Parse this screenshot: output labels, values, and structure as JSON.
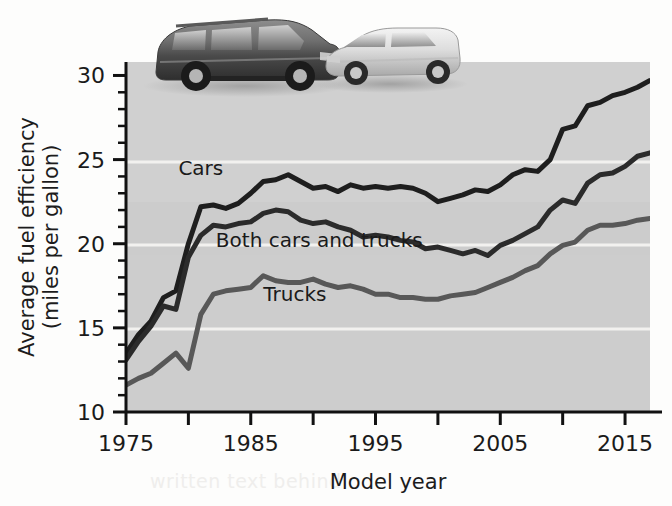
{
  "chart_data": {
    "type": "line",
    "title": "",
    "xlabel": "Model year",
    "ylabel": "Average fuel efficiency\n(miles per gallon)",
    "ylabel_line1": "Average fuel efficiency",
    "ylabel_line2": "(miles per gallon)",
    "xlim": [
      1975,
      2017
    ],
    "ylim": [
      10,
      30.8
    ],
    "xticks": [
      1975,
      1980,
      1985,
      1990,
      1995,
      2000,
      2005,
      2010,
      2015
    ],
    "xtick_labels": [
      "1975",
      "",
      "1985",
      "",
      "1995",
      "",
      "2005",
      "",
      "2015"
    ],
    "yticks": [
      10,
      11,
      12,
      13,
      14,
      15,
      16,
      17,
      18,
      19,
      20,
      21,
      22,
      23,
      24,
      25,
      26,
      27,
      28,
      29,
      30
    ],
    "ytick_labels": [
      "10",
      "",
      "",
      "",
      "",
      "15",
      "",
      "",
      "",
      "",
      "20",
      "",
      "",
      "",
      "",
      "25",
      "",
      "",
      "",
      "",
      "30"
    ],
    "gridlines": [
      15,
      20,
      25,
      30
    ],
    "grid": true,
    "grid_color": "#f4f4f2",
    "plot_background": "#cfcfcf",
    "legend": "inline-labels",
    "x": [
      1975,
      1976,
      1977,
      1978,
      1979,
      1980,
      1981,
      1982,
      1983,
      1984,
      1985,
      1986,
      1987,
      1988,
      1989,
      1990,
      1991,
      1992,
      1993,
      1994,
      1995,
      1996,
      1997,
      1998,
      1999,
      2000,
      2001,
      2002,
      2003,
      2004,
      2005,
      2006,
      2007,
      2008,
      2009,
      2010,
      2011,
      2012,
      2013,
      2014,
      2015,
      2016,
      2017
    ],
    "series": [
      {
        "name": "Cars",
        "color": "#1e1e1e",
        "label_x": 1979.2,
        "label_y": 24.1,
        "values": [
          13.5,
          14.6,
          15.4,
          16.8,
          17.2,
          20.0,
          22.2,
          22.3,
          22.1,
          22.4,
          23.0,
          23.7,
          23.8,
          24.1,
          23.7,
          23.3,
          23.4,
          23.1,
          23.5,
          23.3,
          23.4,
          23.3,
          23.4,
          23.3,
          23.0,
          22.5,
          22.7,
          22.9,
          23.2,
          23.1,
          23.5,
          24.1,
          24.4,
          24.3,
          25.0,
          26.8,
          27.0,
          28.2,
          28.4,
          28.8,
          29.0,
          29.3,
          29.7
        ]
      },
      {
        "name": "Both cars and trucks",
        "color": "#2b2b2b",
        "label_x": 1982.2,
        "label_y": 19.8,
        "values": [
          13.1,
          14.2,
          15.1,
          16.3,
          16.1,
          19.2,
          20.5,
          21.1,
          21.0,
          21.2,
          21.3,
          21.8,
          22.0,
          21.9,
          21.4,
          21.2,
          21.3,
          21.0,
          20.8,
          20.4,
          20.5,
          20.4,
          20.2,
          20.1,
          19.7,
          19.8,
          19.6,
          19.4,
          19.6,
          19.3,
          19.9,
          20.2,
          20.6,
          21.0,
          22.0,
          22.6,
          22.4,
          23.6,
          24.1,
          24.2,
          24.6,
          25.2,
          25.4
        ]
      },
      {
        "name": "Trucks",
        "color": "#585858",
        "label_x": 1986.0,
        "label_y": 16.6,
        "values": [
          11.6,
          12.0,
          12.3,
          12.9,
          13.5,
          12.6,
          15.8,
          17.0,
          17.2,
          17.3,
          17.4,
          18.1,
          17.8,
          17.7,
          17.7,
          17.9,
          17.6,
          17.4,
          17.5,
          17.3,
          17.0,
          17.0,
          16.8,
          16.8,
          16.7,
          16.7,
          16.9,
          17.0,
          17.1,
          17.4,
          17.7,
          18.0,
          18.4,
          18.7,
          19.4,
          19.9,
          20.1,
          20.8,
          21.1,
          21.1,
          21.2,
          21.4,
          21.5
        ]
      }
    ]
  },
  "images": {
    "suv_alt": "dark sport utility vehicle photo",
    "sedan_alt": "light silver sedan photo"
  },
  "background_text": {
    "line1": "I can't tell",
    "line2": "written text behind"
  }
}
